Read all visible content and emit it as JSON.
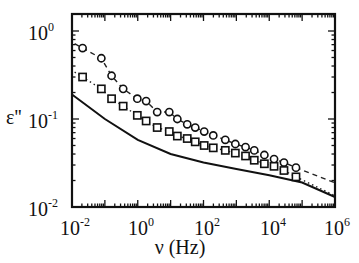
{
  "chart_data": {
    "type": "scatter",
    "title": "",
    "xlabel": "ν (Hz)",
    "ylabel": "ε''",
    "xscale": "log",
    "yscale": "log",
    "xlim": [
      0.01,
      1000000
    ],
    "ylim": [
      0.01,
      1.6
    ],
    "x_ticks": [
      "10^-2",
      "10^0",
      "10^2",
      "10^4",
      "10^6"
    ],
    "y_ticks": [
      "10^-2",
      "10^-1",
      "10^0"
    ],
    "grid": false,
    "legend": null,
    "series": [
      {
        "name": "circles",
        "marker": "open-circle",
        "line": "dashed fit",
        "x": [
          0.021,
          0.078,
          0.16,
          0.36,
          0.97,
          1.8,
          3.9,
          9.1,
          16,
          32,
          56,
          105,
          198,
          460,
          930,
          1900,
          3500,
          7100,
          14000,
          28000,
          65000
        ],
        "y": [
          0.64,
          0.49,
          0.31,
          0.22,
          0.17,
          0.16,
          0.12,
          0.12,
          0.1,
          0.087,
          0.08,
          0.072,
          0.065,
          0.058,
          0.052,
          0.048,
          0.044,
          0.039,
          0.035,
          0.032,
          0.028
        ]
      },
      {
        "name": "squares",
        "marker": "open-square",
        "line": "dotted fit",
        "x": [
          0.021,
          0.078,
          0.16,
          0.36,
          0.97,
          1.8,
          3.9,
          9.1,
          16,
          32,
          56,
          105,
          198,
          460,
          930,
          1900,
          3500,
          7100,
          14000,
          28000,
          65000
        ],
        "y": [
          0.3,
          0.22,
          0.17,
          0.14,
          0.11,
          0.095,
          0.08,
          0.072,
          0.064,
          0.06,
          0.055,
          0.05,
          0.047,
          0.044,
          0.041,
          0.038,
          0.034,
          0.031,
          0.029,
          0.026,
          0.022
        ]
      },
      {
        "name": "solid line",
        "marker": "none",
        "line": "solid",
        "x": [
          0.01,
          0.1,
          1,
          10,
          100,
          1000,
          10000,
          100000,
          1000000
        ],
        "y": [
          0.19,
          0.1,
          0.058,
          0.04,
          0.032,
          0.027,
          0.023,
          0.019,
          0.013
        ]
      }
    ]
  },
  "labels": {
    "xlabel": "ν (Hz)",
    "ylabel": "ε''",
    "x_ticks": [
      {
        "base": "10",
        "exp": "-2"
      },
      {
        "base": "10",
        "exp": "0"
      },
      {
        "base": "10",
        "exp": "2"
      },
      {
        "base": "10",
        "exp": "4"
      },
      {
        "base": "10",
        "exp": "6"
      }
    ],
    "y_ticks": [
      {
        "base": "10",
        "exp": "0"
      },
      {
        "base": "10",
        "exp": "-1"
      },
      {
        "base": "10",
        "exp": "-2"
      }
    ]
  }
}
